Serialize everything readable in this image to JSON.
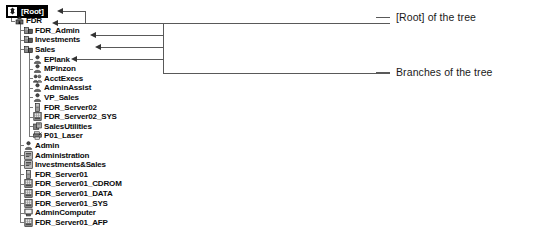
{
  "tree": {
    "nodes": [
      {
        "label": "[Root]",
        "icon": "root-tree-icon",
        "level": 0,
        "selected": true
      },
      {
        "label": "FDR",
        "icon": "organization-icon",
        "level": 1,
        "selected": false
      },
      {
        "label": "FDR_Admin",
        "icon": "organizational-unit-icon",
        "level": 2,
        "selected": false
      },
      {
        "label": "Investments",
        "icon": "organizational-unit-icon",
        "level": 2,
        "selected": false
      },
      {
        "label": "Sales",
        "icon": "organizational-unit-icon",
        "level": 2,
        "selected": false
      },
      {
        "label": "EPlank",
        "icon": "user-icon",
        "level": 3,
        "selected": false
      },
      {
        "label": "MPinzon",
        "icon": "user-icon",
        "level": 3,
        "selected": false
      },
      {
        "label": "AcctExecs",
        "icon": "group-icon",
        "level": 3,
        "selected": false
      },
      {
        "label": "AdminAssist",
        "icon": "user-icon",
        "level": 3,
        "selected": false
      },
      {
        "label": "VP_Sales",
        "icon": "user-icon",
        "level": 3,
        "selected": false
      },
      {
        "label": "FDR_Server02",
        "icon": "server-icon",
        "level": 3,
        "selected": false
      },
      {
        "label": "FDR_Server02_SYS",
        "icon": "volume-icon",
        "level": 3,
        "selected": false
      },
      {
        "label": "SalesUtilities",
        "icon": "directory-map-icon",
        "level": 3,
        "selected": false
      },
      {
        "label": "P01_Laser",
        "icon": "printer-icon",
        "level": 3,
        "selected": false
      },
      {
        "label": "Admin",
        "icon": "user-icon",
        "level": 2,
        "selected": false
      },
      {
        "label": "Administration",
        "icon": "profile-icon",
        "level": 2,
        "selected": false
      },
      {
        "label": "Investments&Sales",
        "icon": "profile-icon",
        "level": 2,
        "selected": false
      },
      {
        "label": "FDR_Server01",
        "icon": "server-icon",
        "level": 2,
        "selected": false
      },
      {
        "label": "FDR_Server01_CDROM",
        "icon": "volume-icon",
        "level": 2,
        "selected": false
      },
      {
        "label": "FDR_Server01_DATA",
        "icon": "volume-icon",
        "level": 2,
        "selected": false
      },
      {
        "label": "FDR_Server01_SYS",
        "icon": "volume-icon",
        "level": 2,
        "selected": false
      },
      {
        "label": "AdminComputer",
        "icon": "computer-icon",
        "level": 2,
        "selected": false
      },
      {
        "label": "FDR_Server01_AFP",
        "icon": "volume-icon",
        "level": 2,
        "selected": false
      }
    ]
  },
  "annotations": {
    "root_label": "[Root] of the tree",
    "branches_label": "Branches of the tree"
  },
  "colors": {
    "line": "#595959",
    "guide": "#777777",
    "text": "#0b0b0b",
    "selection_bg": "#000000",
    "selection_fg": "#ffffff"
  }
}
